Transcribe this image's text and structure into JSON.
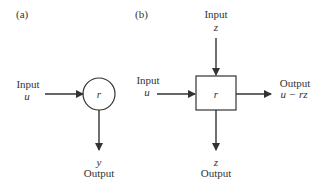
{
  "panel_a": {
    "label": "(a)",
    "node_label": "r",
    "input_label": "Input",
    "input_var": "u",
    "output_label": "Output",
    "output_var": "y"
  },
  "panel_b": {
    "label": "(b)",
    "node_label": "r",
    "top_input_label": "Input",
    "top_input_var": "z",
    "left_input_label": "Input",
    "left_input_var": "u",
    "right_output_label": "Output",
    "right_output_var": "u − rz",
    "bottom_output_label": "Output",
    "bottom_output_var": "z"
  },
  "colors": {
    "stroke": "#333333",
    "background": "#ffffff"
  }
}
